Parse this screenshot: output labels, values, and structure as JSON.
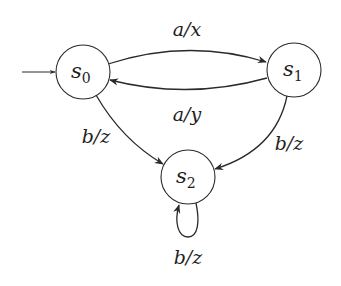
{
  "diagram": {
    "type": "finite-state-machine (Mealy)",
    "initial_state": "s0",
    "states": [
      {
        "id": "s0",
        "name": "s",
        "sub": "0",
        "cx": 83,
        "cy": 72,
        "r": 27
      },
      {
        "id": "s1",
        "name": "s",
        "sub": "1",
        "cx": 294,
        "cy": 70,
        "r": 27
      },
      {
        "id": "s2",
        "name": "s",
        "sub": "2",
        "cx": 188,
        "cy": 177,
        "r": 27
      }
    ],
    "transitions": [
      {
        "from": "s0",
        "to": "s1",
        "label": "a/x"
      },
      {
        "from": "s1",
        "to": "s0",
        "label": "a/y"
      },
      {
        "from": "s0",
        "to": "s2",
        "label": "b/z"
      },
      {
        "from": "s1",
        "to": "s2",
        "label": "b/z"
      },
      {
        "from": "s2",
        "to": "s2",
        "label": "b/z"
      }
    ],
    "colors": {
      "stroke": "#2a2a2a",
      "text": "#1e1e1e",
      "background": "#ffffff"
    }
  }
}
